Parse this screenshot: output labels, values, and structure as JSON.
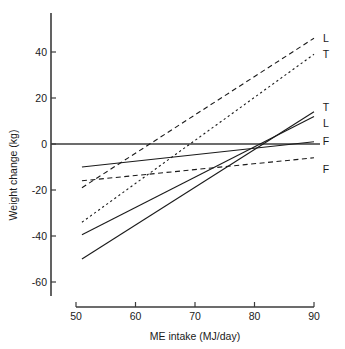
{
  "chart_data": {
    "type": "line",
    "title": "",
    "xlabel": "ME intake (MJ/day)",
    "ylabel": "Weight change (kg)",
    "xlim": [
      48,
      91
    ],
    "ylim": [
      -68,
      50
    ],
    "xticks": [
      50,
      60,
      70,
      80,
      90
    ],
    "xtick_labels": [
      "50",
      "60",
      "70",
      "80",
      "90"
    ],
    "yticks": [
      40,
      20,
      0,
      -20,
      -40,
      -60
    ],
    "ytick_labels": [
      "40",
      "20",
      "0",
      "-20",
      "-40",
      "-60"
    ],
    "grid": false,
    "legend": "right-edge-inline",
    "zero_reference_line": 0,
    "series": [
      {
        "name": "L-dashed",
        "label": "L",
        "style": "dashed",
        "x": [
          51,
          90
        ],
        "y": [
          -19,
          46
        ],
        "label_y": 46
      },
      {
        "name": "T-dashed",
        "label": "T",
        "style": "dotted",
        "x": [
          51,
          90
        ],
        "y": [
          -34,
          39
        ],
        "label_y": 39
      },
      {
        "name": "T-solid",
        "label": "T",
        "style": "solid",
        "x": [
          51,
          90
        ],
        "y": [
          -50,
          14
        ],
        "label_y": 16
      },
      {
        "name": "L-solid",
        "label": "L",
        "style": "solid",
        "x": [
          51,
          90
        ],
        "y": [
          -39.5,
          12
        ],
        "label_y": 9
      },
      {
        "name": "F-solid",
        "label": "F",
        "style": "solid",
        "x": [
          51,
          90
        ],
        "y": [
          -10,
          1
        ],
        "label_y": 1.5
      },
      {
        "name": "F-dashed",
        "label": "F",
        "style": "dashed",
        "x": [
          51,
          90
        ],
        "y": [
          -16,
          -6
        ],
        "label_y": -11
      }
    ]
  },
  "axes": {
    "x_title": "ME intake (MJ/day)",
    "y_title": "Weight change (kg)"
  }
}
